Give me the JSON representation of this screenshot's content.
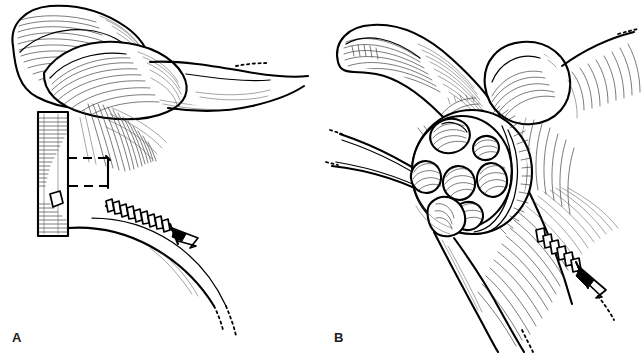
{
  "figure": {
    "type": "two-panel surgical line illustration",
    "background_color": "#ffffff",
    "ink_color": "#000000",
    "width": 644,
    "height": 354
  },
  "panels": [
    {
      "id": "A",
      "label": "A",
      "caption_text": "A",
      "description": "Shoulder/coracoid region with rectangular bone block, dashed osteotomy outline and a bone screw directed laterally",
      "elements": {
        "bone_block_label": "bone block",
        "dashed_outline_label": "osteotomy outline",
        "screw_label": "bone screw",
        "superior_bone_label": "acromion / clavicle",
        "coracoid_label": "coracoid process"
      }
    },
    {
      "id": "B",
      "label": "B",
      "caption_text": "B",
      "description": "Same region with circular multi-bit reamer / trephine instrument on a handle seated against bone, and a bone screw driven inferiorly",
      "elements": {
        "reamer_label": "circular reamer head",
        "reamer_bit_count": 6,
        "handle_label": "instrument handle",
        "screw_label": "bone screw",
        "humeral_head_label": "humeral head",
        "clavicle_label": "clavicle"
      }
    }
  ],
  "labels": {
    "panel_a": "A",
    "panel_b": "B"
  }
}
